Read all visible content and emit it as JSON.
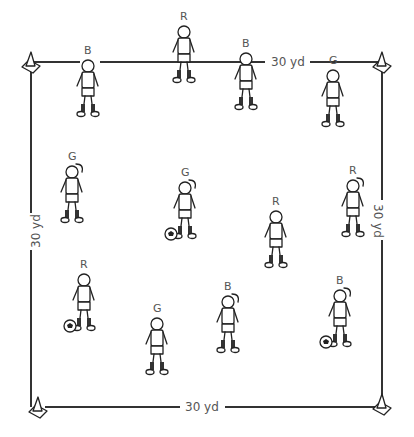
{
  "field": {
    "width_label": "30 yd",
    "top_label": "30 yd",
    "bottom_label": "30 yd",
    "left_label": "30 yd",
    "right_label": "30 yd",
    "corners": [
      "cone-top-left",
      "cone-top-right",
      "cone-bottom-left",
      "cone-bottom-right"
    ]
  },
  "players": [
    {
      "team": "B",
      "x": 88,
      "y": 62,
      "ball": false,
      "girl": false
    },
    {
      "team": "R",
      "x": 184,
      "y": 28,
      "ball": false,
      "girl": false
    },
    {
      "team": "B",
      "x": 246,
      "y": 55,
      "ball": false,
      "girl": false
    },
    {
      "team": "G",
      "x": 333,
      "y": 72,
      "ball": false,
      "girl": false
    },
    {
      "team": "G",
      "x": 72,
      "y": 168,
      "ball": false,
      "girl": true
    },
    {
      "team": "G",
      "x": 185,
      "y": 184,
      "ball": true,
      "girl": true
    },
    {
      "team": "R",
      "x": 276,
      "y": 213,
      "ball": false,
      "girl": false
    },
    {
      "team": "R",
      "x": 353,
      "y": 182,
      "ball": false,
      "girl": true
    },
    {
      "team": "R",
      "x": 84,
      "y": 276,
      "ball": true,
      "girl": false
    },
    {
      "team": "G",
      "x": 157,
      "y": 320,
      "ball": false,
      "girl": false
    },
    {
      "team": "B",
      "x": 228,
      "y": 298,
      "ball": false,
      "girl": true
    },
    {
      "team": "B",
      "x": 340,
      "y": 292,
      "ball": true,
      "girl": true
    }
  ]
}
